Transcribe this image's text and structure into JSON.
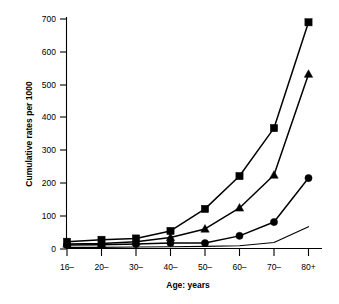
{
  "chart_data": {
    "type": "line",
    "title": "",
    "xlabel": "Age: years",
    "ylabel": "Cumulative rates per 1000",
    "categories": [
      "16–",
      "20–",
      "30–",
      "40–",
      "50–",
      "60–",
      "70–",
      "80+"
    ],
    "ylim": [
      0,
      700
    ],
    "yticks": [
      0,
      100,
      200,
      300,
      400,
      500,
      600,
      700
    ],
    "ytick_labels": [
      "0",
      "100",
      "200",
      "300",
      "400",
      "500",
      "600",
      "700"
    ],
    "grid": false,
    "legend": "none",
    "series": [
      {
        "name": "series-square",
        "marker": "square",
        "values": [
          22,
          28,
          32,
          55,
          122,
          222,
          368,
          690
        ]
      },
      {
        "name": "series-triangle",
        "marker": "triangle",
        "values": [
          15,
          17,
          22,
          35,
          61,
          125,
          225,
          532
        ]
      },
      {
        "name": "series-circle",
        "marker": "circle",
        "values": [
          12,
          13,
          15,
          18,
          18,
          40,
          82,
          216
        ]
      },
      {
        "name": "series-plain",
        "marker": "none",
        "values": [
          5,
          5,
          6,
          7,
          8,
          10,
          20,
          68
        ]
      }
    ]
  },
  "axes": {
    "y_title": "Cumulative rates per 1000",
    "x_title": "Age: years",
    "y_ticks": [
      "700",
      "600",
      "500",
      "400",
      "300",
      "200",
      "100",
      "0"
    ],
    "x_ticks": [
      "16–",
      "20–",
      "30–",
      "40–",
      "50–",
      "60–",
      "70–",
      "80+"
    ]
  },
  "colors": {
    "ink": "#000000",
    "background": "#ffffff"
  }
}
